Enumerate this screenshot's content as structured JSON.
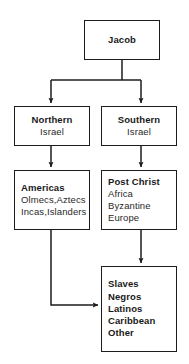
{
  "diagram": {
    "background_color": "#ffffff",
    "stroke_color": "#1c1c1c",
    "text_color": "#1a1a1a"
  },
  "nodes": {
    "jacob": {
      "name": "Jacob",
      "lines": [
        {
          "text": "Jacob",
          "bold": true
        }
      ]
    },
    "northern_israel": {
      "name": "Northern Israel",
      "lines": [
        {
          "text": "Northern",
          "bold": true
        },
        {
          "text": "Israel",
          "bold": false
        }
      ]
    },
    "southern_israel": {
      "name": "Southern Israel",
      "lines": [
        {
          "text": "Southern",
          "bold": true
        },
        {
          "text": "Israel",
          "bold": false
        }
      ]
    },
    "americas": {
      "name": "Americas",
      "lines": [
        {
          "text": "Americas",
          "bold": true
        },
        {
          "text": "Olmecs,Aztecs",
          "bold": false
        },
        {
          "text": "Incas,Islanders",
          "bold": false
        }
      ]
    },
    "post_christ": {
      "name": "Post Christ",
      "lines": [
        {
          "text": "Post Christ",
          "bold": true
        },
        {
          "text": "Africa",
          "bold": false
        },
        {
          "text": "Byzantine",
          "bold": false
        },
        {
          "text": "Europe",
          "bold": false
        }
      ]
    },
    "slaves": {
      "name": "Slaves Negros Latinos Caribbean Other",
      "lines": [
        {
          "text": "Slaves",
          "bold": true
        },
        {
          "text": "Negros",
          "bold": true
        },
        {
          "text": "Latinos",
          "bold": true
        },
        {
          "text": "Caribbean",
          "bold": true
        },
        {
          "text": "Other",
          "bold": true
        }
      ]
    }
  },
  "edges": [
    {
      "from": "jacob",
      "to": "northern_israel",
      "style": "elbow",
      "arrow": true
    },
    {
      "from": "jacob",
      "to": "southern_israel",
      "style": "elbow",
      "arrow": true
    },
    {
      "from": "northern_israel",
      "to": "americas",
      "style": "straight",
      "arrow": true
    },
    {
      "from": "southern_israel",
      "to": "post_christ",
      "style": "straight",
      "arrow": true
    },
    {
      "from": "post_christ",
      "to": "slaves",
      "style": "straight",
      "arrow": true
    },
    {
      "from": "americas",
      "to": "slaves",
      "style": "elbow",
      "arrow": true
    }
  ]
}
